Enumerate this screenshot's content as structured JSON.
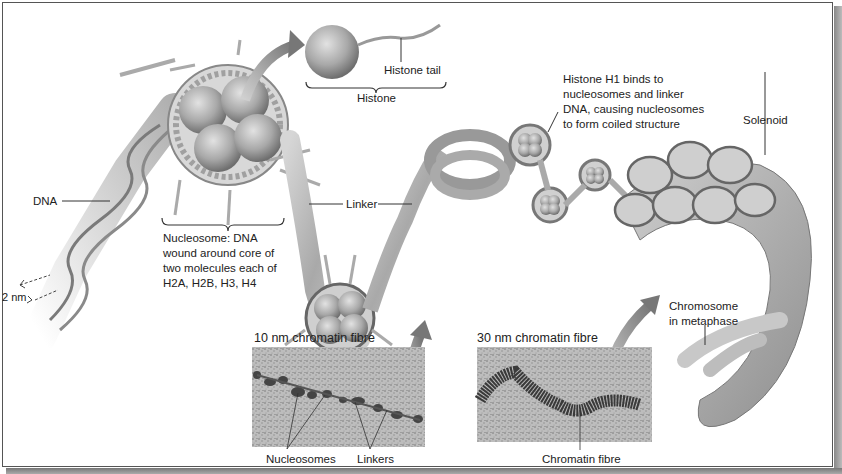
{
  "diagram": {
    "labels": {
      "histone_tail": "Histone tail",
      "histone": "Histone",
      "dna": "DNA",
      "scale": "2 nm",
      "nucleosome": "Nucleosome: DNA wound around core of two molecules each of H2A, H2B, H3, H4",
      "nucleosome_lines": [
        "Nucleosome: DNA",
        "wound around core of",
        "two molecules each of",
        "H2A, H2B, H3, H4"
      ],
      "linker": "Linker",
      "histone_h1": "Histone H1 binds to nucleosomes and linker DNA, causing nucleosomes to form coiled structure",
      "histone_h1_lines": [
        "Histone H1 binds to",
        "nucleosomes and linker",
        "DNA, causing nucleosomes",
        "to form coiled structure"
      ],
      "solenoid": "Solenoid",
      "chromosome_lines": [
        "Chromosome",
        "in metaphase"
      ]
    },
    "micrographs": [
      {
        "title": "10 nm chromatin fibre",
        "callouts": [
          "Nucleosomes",
          "Linkers"
        ]
      },
      {
        "title": "30 nm chromatin fibre",
        "callouts": [
          "Chromatin fibre"
        ]
      }
    ],
    "colors": {
      "line": "#333333",
      "histone_fill": "#9a9a9a",
      "dna_fill": "#c8c8c8",
      "arrow": "#8a8a8a",
      "micrograph_bg": "#b8b8b8"
    }
  }
}
